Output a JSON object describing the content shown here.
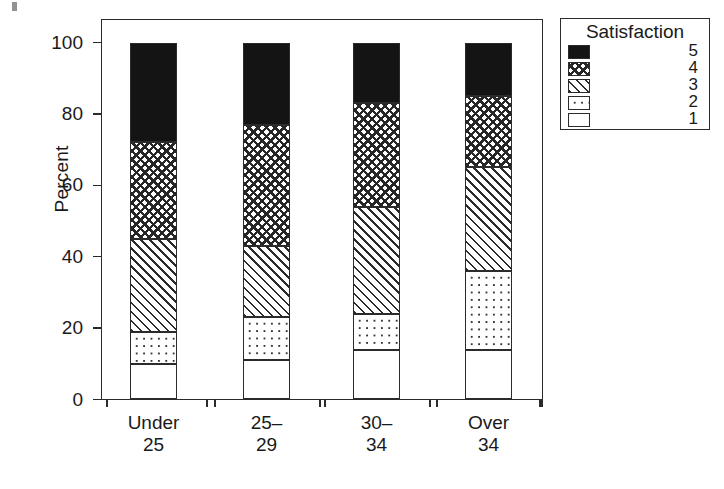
{
  "chart_data": {
    "type": "bar",
    "subtype": "stacked-percent",
    "title": "",
    "xlabel": "",
    "ylabel": "Percent",
    "ylim": [
      0,
      100
    ],
    "yticks": [
      0,
      20,
      40,
      60,
      80,
      100
    ],
    "ytick_labels": [
      "0",
      "20",
      "40",
      "60",
      "80",
      "100"
    ],
    "grid": false,
    "categories": [
      "Under 25",
      "25– 29",
      "30– 34",
      "Over 34"
    ],
    "category_lines": [
      [
        "Under",
        "25"
      ],
      [
        "25–",
        "29"
      ],
      [
        "30–",
        "34"
      ],
      [
        "Over",
        "34"
      ]
    ],
    "legend": {
      "title": "Satisfaction",
      "position": "right",
      "entries": [
        {
          "label": "5",
          "pattern": "solid-black"
        },
        {
          "label": "4",
          "pattern": "cross-hatch"
        },
        {
          "label": "3",
          "pattern": "diagonal-hatch"
        },
        {
          "label": "2",
          "pattern": "dot-grid"
        },
        {
          "label": "1",
          "pattern": "empty-white"
        }
      ]
    },
    "stack_order_bottom_to_top": [
      "1",
      "2",
      "3",
      "4",
      "5"
    ],
    "series": [
      {
        "name": "1",
        "pattern": "empty-white",
        "values": [
          10,
          11,
          14,
          14
        ]
      },
      {
        "name": "2",
        "pattern": "dot-grid",
        "values": [
          9,
          12,
          10,
          22
        ]
      },
      {
        "name": "3",
        "pattern": "diagonal-hatch",
        "values": [
          26,
          20,
          30,
          29
        ]
      },
      {
        "name": "4",
        "pattern": "cross-hatch",
        "values": [
          27,
          34,
          29,
          20
        ]
      },
      {
        "name": "5",
        "pattern": "solid-black",
        "values": [
          28,
          23,
          17,
          15
        ]
      }
    ],
    "cumulative_tops": [
      {
        "category": "Under 25",
        "tops": [
          10,
          19,
          45,
          72,
          100
        ]
      },
      {
        "category": "25– 29",
        "tops": [
          11,
          23,
          43,
          77,
          100
        ]
      },
      {
        "category": "30– 34",
        "tops": [
          14,
          24,
          54,
          83,
          100
        ]
      },
      {
        "category": "Over 34",
        "tops": [
          14,
          36,
          65,
          85,
          100
        ]
      }
    ],
    "colors": {
      "axis": "#2b2b2b",
      "solid_black": "#141414",
      "background": "#ffffff"
    }
  }
}
